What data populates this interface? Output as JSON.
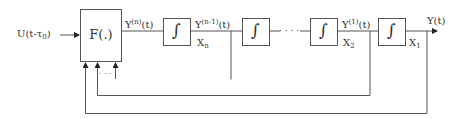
{
  "diagram": {
    "type": "block-diagram",
    "input": {
      "label_main": "U(t-τ",
      "label_sub": "0",
      "label_end": ")"
    },
    "function_block": {
      "label": "F(.)"
    },
    "integrator_symbol": "∫",
    "signals": [
      {
        "id": "yn",
        "base": "Y",
        "sup": "(n)",
        "tail": "(t)"
      },
      {
        "id": "yn1",
        "base": "Y",
        "sup": "(n-1)",
        "tail": "(t)",
        "state": "X",
        "state_sub": "n"
      },
      {
        "id": "y1",
        "base": "Y",
        "sup": "(1)",
        "tail": "(t)",
        "state": "X",
        "state_sub": "2"
      },
      {
        "id": "y",
        "base": "Y(t)",
        "state": "X",
        "state_sub": "1"
      }
    ],
    "ellipsis_chain": "· · · ·",
    "ellipsis_feedback": "· · ·",
    "colors": {
      "line": "#555555",
      "text": "#333333",
      "background": "#ffffff"
    }
  }
}
